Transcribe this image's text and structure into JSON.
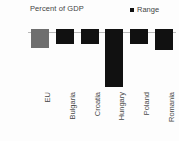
{
  "chart_data": {
    "type": "bar",
    "title": "Percent of GDP",
    "xlabel": "",
    "ylabel": "Percent of GDP",
    "categories": [
      "EU",
      "Bulgaria",
      "Croatia",
      "Hungary",
      "Poland",
      "Romania"
    ],
    "values": [
      -2.5,
      -2.0,
      -2.0,
      -7.6,
      -2.0,
      -2.8
    ],
    "series": [
      {
        "name": "Range",
        "values": [
          -2.5,
          -2.0,
          -2.0,
          -7.6,
          -2.0,
          -2.8
        ]
      }
    ],
    "ylim": [
      -8,
      2
    ],
    "yticks": [
      2,
      0,
      -2,
      -4,
      -6,
      -8
    ],
    "ytick_labels": [
      "2",
      "0",
      "-2",
      "-4",
      "-6",
      "-8"
    ],
    "grid": false,
    "legend": {
      "position": "top-right",
      "entries": [
        {
          "label": "Range",
          "color": "#111111",
          "marker": "square"
        }
      ]
    },
    "colors": {
      "default_bar": "#111111",
      "highlight_bar": "#6e6e6e",
      "axis_line": "#b9b9b9",
      "text": "#4a4a4a",
      "background": "#fdfdfd"
    },
    "highlight_category": "EU",
    "bar_labels_visible": false
  }
}
